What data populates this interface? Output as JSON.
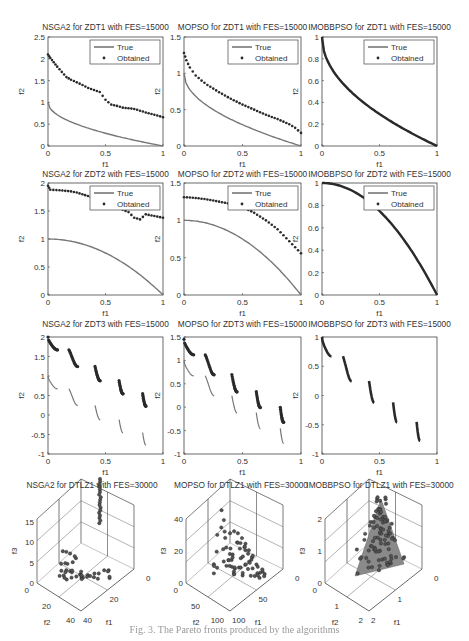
{
  "figure": {
    "caption": "Fig. 3. The Pareto fronts produced by the algorithms"
  },
  "legend": {
    "true_label": "True",
    "obtained_label": "Obtained"
  },
  "chart_data": [
    {
      "type": "line+scatter",
      "title": "NSGA2 for ZDT1 with FES=15000",
      "xlabel": "f1",
      "ylabel": "f2",
      "xlim": [
        0,
        1
      ],
      "ylim": [
        0,
        2.5
      ],
      "xticks": [
        0,
        0.5,
        1
      ],
      "yticks": [
        0,
        0.5,
        1,
        1.5,
        2,
        2.5
      ],
      "true_front": "ZDT1",
      "legend": [
        "True",
        "Obtained"
      ],
      "obtained": [
        [
          0,
          2.1
        ],
        [
          0.02,
          2.02
        ],
        [
          0.05,
          1.92
        ],
        [
          0.08,
          1.82
        ],
        [
          0.12,
          1.7
        ],
        [
          0.16,
          1.58
        ],
        [
          0.2,
          1.52
        ],
        [
          0.25,
          1.46
        ],
        [
          0.3,
          1.4
        ],
        [
          0.35,
          1.33
        ],
        [
          0.45,
          1.24
        ],
        [
          0.5,
          1.06
        ],
        [
          0.55,
          0.95
        ],
        [
          0.6,
          0.92
        ],
        [
          0.65,
          0.88
        ],
        [
          0.75,
          0.85
        ],
        [
          0.85,
          0.77
        ],
        [
          0.95,
          0.7
        ],
        [
          1.0,
          0.66
        ]
      ]
    },
    {
      "type": "line+scatter",
      "title": "MOPSO for ZDT1 with FES=15000",
      "xlabel": "f1",
      "ylabel": "f2",
      "xlim": [
        0,
        1
      ],
      "ylim": [
        0,
        1.5
      ],
      "xticks": [
        0,
        0.5,
        1
      ],
      "yticks": [
        0,
        0.5,
        1,
        1.5
      ],
      "true_front": "ZDT1",
      "legend": [
        "True",
        "Obtained"
      ],
      "obtained": [
        [
          0,
          1.28
        ],
        [
          0.02,
          1.18
        ],
        [
          0.05,
          1.08
        ],
        [
          0.1,
          0.97
        ],
        [
          0.15,
          0.9
        ],
        [
          0.2,
          0.84
        ],
        [
          0.3,
          0.74
        ],
        [
          0.4,
          0.65
        ],
        [
          0.5,
          0.57
        ],
        [
          0.6,
          0.5
        ],
        [
          0.7,
          0.43
        ],
        [
          0.8,
          0.37
        ],
        [
          0.9,
          0.3
        ],
        [
          0.95,
          0.25
        ],
        [
          1.0,
          0.18
        ]
      ]
    },
    {
      "type": "line+scatter",
      "title": "IMOBBPSO for ZDT1 with FES=15000",
      "xlabel": "f1",
      "ylabel": "f2",
      "xlim": [
        0,
        1
      ],
      "ylim": [
        0,
        1
      ],
      "xticks": [
        0,
        0.5,
        1
      ],
      "yticks": [
        0,
        0.2,
        0.4,
        0.6,
        0.8,
        1
      ],
      "true_front": "ZDT1",
      "legend": [
        "True",
        "Obtained"
      ],
      "obtained": "on true front"
    },
    {
      "type": "line+scatter",
      "title": "NSGA2 for ZDT2 with FES=15000",
      "xlabel": "f1",
      "ylabel": "f2",
      "xlim": [
        0,
        1
      ],
      "ylim": [
        0,
        2
      ],
      "xticks": [
        0,
        0.5,
        1
      ],
      "yticks": [
        0,
        0.5,
        1,
        1.5,
        2
      ],
      "true_front": "ZDT2",
      "legend": [
        "True",
        "Obtained"
      ],
      "obtained": [
        [
          0,
          1.95
        ],
        [
          0.02,
          1.88
        ],
        [
          0.1,
          1.87
        ],
        [
          0.15,
          1.86
        ],
        [
          0.2,
          1.85
        ],
        [
          0.25,
          1.83
        ],
        [
          0.42,
          1.72
        ],
        [
          0.7,
          1.48
        ],
        [
          0.75,
          1.38
        ],
        [
          0.8,
          1.35
        ],
        [
          0.85,
          1.44
        ],
        [
          0.9,
          1.42
        ],
        [
          0.95,
          1.4
        ],
        [
          1.0,
          1.38
        ]
      ]
    },
    {
      "type": "line+scatter",
      "title": "MOPSO for ZDT2 with FES=15000",
      "xlabel": "f1",
      "ylabel": "f2",
      "xlim": [
        0,
        1
      ],
      "ylim": [
        0,
        1.5
      ],
      "xticks": [
        0,
        0.5,
        1
      ],
      "yticks": [
        0,
        0.5,
        1,
        1.5
      ],
      "true_front": "ZDT2",
      "legend": [
        "True",
        "Obtained"
      ],
      "obtained": [
        [
          0,
          1.31
        ],
        [
          0.1,
          1.3
        ],
        [
          0.2,
          1.28
        ],
        [
          0.3,
          1.25
        ],
        [
          0.4,
          1.22
        ],
        [
          0.5,
          1.18
        ],
        [
          0.6,
          1.1
        ],
        [
          0.7,
          1.0
        ],
        [
          0.8,
          0.88
        ],
        [
          0.9,
          0.72
        ],
        [
          1.0,
          0.56
        ]
      ]
    },
    {
      "type": "line+scatter",
      "title": "IMOBBPSO for ZDT2 with FES=15000",
      "xlabel": "f1",
      "ylabel": "f2",
      "xlim": [
        0,
        1
      ],
      "ylim": [
        0,
        1
      ],
      "xticks": [
        0,
        0.5,
        1
      ],
      "yticks": [
        0,
        0.2,
        0.4,
        0.6,
        0.8,
        1
      ],
      "true_front": "ZDT2",
      "legend": [
        "True",
        "Obtained"
      ],
      "obtained": "on true front"
    },
    {
      "type": "line+scatter",
      "title": "NSGA2 for ZDT3 with FES=15000",
      "xlabel": "f1",
      "ylabel": "f2",
      "xlim": [
        0,
        1
      ],
      "ylim": [
        -1,
        2
      ],
      "xticks": [
        0,
        0.5,
        1
      ],
      "yticks": [
        -1,
        -0.5,
        0,
        0.5,
        1,
        1.5,
        2
      ],
      "true_front": "ZDT3",
      "offset": 1.0
    },
    {
      "type": "line+scatter",
      "title": "MOPSO for ZDT3 with FES=15000",
      "xlabel": "f1",
      "ylabel": "f2",
      "xlim": [
        0,
        1
      ],
      "ylim": [
        -1,
        1.5
      ],
      "xticks": [
        0,
        0.5,
        1
      ],
      "yticks": [
        -1,
        -0.5,
        0,
        0.5,
        1,
        1.5
      ],
      "true_front": "ZDT3",
      "offset": 0.45
    },
    {
      "type": "line+scatter",
      "title": "IMOBBPSO for ZDT3 with FES=15000",
      "xlabel": "f1",
      "ylabel": "f2",
      "xlim": [
        0,
        1
      ],
      "ylim": [
        -1,
        1
      ],
      "xticks": [
        0,
        0.5,
        1
      ],
      "yticks": [
        -1,
        -0.5,
        0,
        0.5,
        1
      ],
      "true_front": "ZDT3",
      "offset": 0
    },
    {
      "type": "scatter3d",
      "title": "NSGA2 for DTLZ1 with FES=30000",
      "xlabel": "f1",
      "ylabel": "f2",
      "zlabel": "f3",
      "xticks": [
        0,
        20,
        40
      ],
      "yticks": [
        0,
        20,
        40
      ],
      "zticks": [
        0,
        5,
        10,
        15
      ]
    },
    {
      "type": "scatter3d",
      "title": "MOPSO for DTLZ1 with FES=30000",
      "xlabel": "f1",
      "ylabel": "f2",
      "zlabel": "f3",
      "xticks": [
        0,
        50,
        100
      ],
      "yticks": [
        0,
        50,
        100
      ],
      "zticks": [
        0,
        20,
        40
      ]
    },
    {
      "type": "scatter3d",
      "title": "IMOBBPSO for DTLZ1 with FES=30000",
      "xlabel": "f1",
      "ylabel": "f2",
      "zlabel": "f3",
      "xticks": [
        0,
        1,
        2
      ],
      "yticks": [
        0,
        1,
        2
      ],
      "zticks": [
        0,
        1,
        2
      ]
    }
  ]
}
